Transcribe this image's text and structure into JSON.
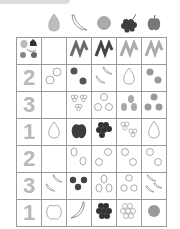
{
  "worksheet": {
    "header_fruits": [
      "pear",
      "banana",
      "orange",
      "grapes",
      "apple"
    ],
    "corner_cell": "mixed-fruits",
    "header_row": [
      "empty",
      "scribble-dark",
      "scribble-dark",
      "scribble-light",
      "scribble-light"
    ],
    "rows": [
      {
        "number": "2",
        "cells": [
          "2 oranges outline",
          "2 dark oranges",
          "2 bananas outline",
          "1 pear outline",
          "2 grey oranges"
        ]
      },
      {
        "number": "3",
        "cells": [
          "empty",
          "3 grapes outline",
          "3 oranges outline",
          "3 grey pears",
          "3 grey oranges"
        ]
      },
      {
        "number": "1",
        "cells": [
          "1 pear outline",
          "1 dark apple",
          "1 dark grapes",
          "2 grapes outline",
          "1 pear outline"
        ]
      },
      {
        "number": "2",
        "cells": [
          "empty",
          "2 pears outline",
          "2 oranges outline",
          "2 oranges outline",
          "2 oranges outline"
        ]
      },
      {
        "number": "3",
        "cells": [
          "2 bananas outline",
          "3 dark oranges",
          "3 pears outline",
          "3 oranges outline",
          "3 bananas outline"
        ]
      },
      {
        "number": "1",
        "cells": [
          "1 apple outline",
          "1 banana outline",
          "1 dark grapes",
          "1 grapes outline",
          "1 grey orange"
        ]
      }
    ]
  },
  "colors": {
    "grid": "#9a9a9a",
    "number": "#b9b9b9",
    "dark": "#4a4a4a",
    "mid": "#8a8a8a",
    "light": "#bdbdbd"
  }
}
